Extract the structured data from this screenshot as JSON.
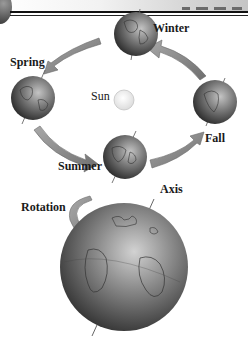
{
  "diagram": {
    "topic": "Earth's revolution around the Sun and rotation on its axis",
    "labels": {
      "winter": "Winter",
      "spring": "Spring",
      "sun": "Sun",
      "fall": "Fall",
      "summer": "Summer",
      "rotation": "Rotation",
      "axis": "Axis"
    },
    "orbit_sequence": [
      "Spring",
      "Summer",
      "Fall",
      "Winter"
    ],
    "colors": {
      "globe_dark": "#2e2e2e",
      "globe_light": "#b8b8b8",
      "arrow": "#8c8c8c",
      "sun": "#f4f4f4",
      "text": "#1a1a1a",
      "rule": "#111111"
    }
  }
}
